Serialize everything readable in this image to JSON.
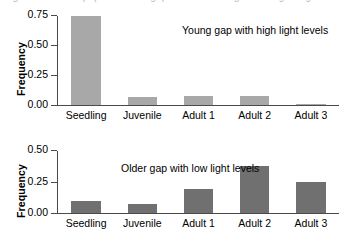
{
  "caption_sliver": "Age structure of populations in gaps of different ages and light regimes",
  "chart_data": [
    {
      "id": "top",
      "type": "bar",
      "title": "",
      "annotation": "Young gap with high light levels",
      "xlabel": "",
      "ylabel": "Frequency",
      "categories": [
        "Seedling",
        "Juvenile",
        "Adult 1",
        "Adult 2",
        "Adult 3"
      ],
      "values": [
        0.75,
        0.07,
        0.08,
        0.08,
        0.01
      ],
      "ylim": [
        0,
        0.75
      ],
      "yticks": [
        0.0,
        0.25,
        0.5,
        0.75
      ],
      "ytick_labels": [
        "0.00",
        "0.25",
        "0.50",
        "0.75"
      ],
      "grid": false,
      "legend": "none",
      "bar_color": "#a8a8a8",
      "axis_color": "#4a4a4a"
    },
    {
      "id": "bottom",
      "type": "bar",
      "title": "",
      "annotation": "Older gap with low light levels",
      "xlabel": "",
      "ylabel": "Frequency",
      "categories": [
        "Seedling",
        "Juvenile",
        "Adult 1",
        "Adult 2",
        "Adult 3"
      ],
      "values": [
        0.1,
        0.07,
        0.19,
        0.38,
        0.25
      ],
      "ylim": [
        0,
        0.5
      ],
      "yticks": [
        0.0,
        0.25,
        0.5
      ],
      "ytick_labels": [
        "0.00",
        "0.25",
        "0.50"
      ],
      "grid": false,
      "legend": "none",
      "bar_color": "#707070",
      "axis_color": "#4a4a4a"
    }
  ]
}
